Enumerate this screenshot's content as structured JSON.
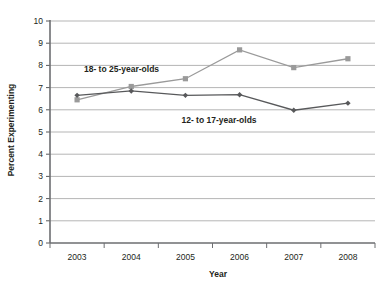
{
  "chart_data": {
    "type": "line",
    "title": "",
    "xlabel": "Year",
    "ylabel": "Percent Experimenting",
    "categories": [
      "2003",
      "2004",
      "2005",
      "2006",
      "2007",
      "2008"
    ],
    "ylim": [
      0,
      10
    ],
    "yticks": [
      "0",
      "1",
      "2",
      "3",
      "4",
      "5",
      "6",
      "7",
      "8",
      "9",
      "10"
    ],
    "grid": "horizontal",
    "legend_position": "inline-annotations",
    "series": [
      {
        "name": "18- to 25-year-olds",
        "color": "#9a9a9a",
        "marker": "square",
        "values": [
          6.45,
          7.05,
          7.4,
          8.7,
          7.9,
          8.3
        ]
      },
      {
        "name": "12- to 17-year-olds",
        "color": "#58595b",
        "marker": "diamond",
        "values": [
          6.65,
          6.85,
          6.65,
          6.68,
          5.98,
          6.3
        ]
      }
    ],
    "annotations": [
      {
        "text": "18- to 25-year-olds",
        "x": 0.82,
        "y": 7.72
      },
      {
        "text": "12- to 17-year-olds",
        "x": 2.62,
        "y": 5.42
      }
    ]
  }
}
